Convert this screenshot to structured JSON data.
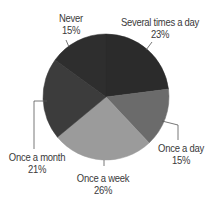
{
  "chart_data": {
    "type": "pie",
    "title": "",
    "categories": [
      "Several times a day",
      "Once a day",
      "Once a week",
      "Once a month",
      "Never"
    ],
    "values": [
      23,
      15,
      26,
      21,
      15
    ],
    "value_labels": [
      "23%",
      "15%",
      "26%",
      "21%",
      "15%"
    ],
    "colors": [
      "#2b2b2b",
      "#6b6b6b",
      "#9b9b9b",
      "#3c3c3c",
      "#2e2e2e"
    ],
    "legend": "none (labels with leader lines)",
    "start_angle_deg": 0,
    "direction": "clockwise"
  },
  "labels": {
    "several": {
      "name": "Several times a day",
      "pct": "23%"
    },
    "once_day": {
      "name": "Once a day",
      "pct": "15%"
    },
    "once_week": {
      "name": "Once a week",
      "pct": "26%"
    },
    "once_month": {
      "name": "Once a month",
      "pct": "21%"
    },
    "never": {
      "name": "Never",
      "pct": "15%"
    }
  }
}
